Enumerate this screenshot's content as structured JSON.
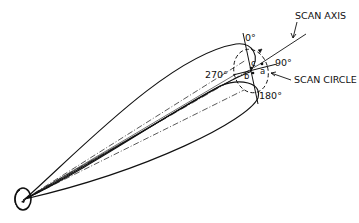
{
  "diagram": {
    "type": "conical-scan antenna beam diagram",
    "labels": {
      "scan_axis": "SCAN AXIS",
      "scan_circle": "SCAN CIRCLE",
      "deg_0": "0°",
      "deg_90": "90°",
      "deg_180": "180°",
      "deg_270": "270°",
      "point_a": "a",
      "point_b": "b",
      "point_c": "c"
    },
    "colors": {
      "stroke": "#111111",
      "background": "#ffffff"
    }
  }
}
